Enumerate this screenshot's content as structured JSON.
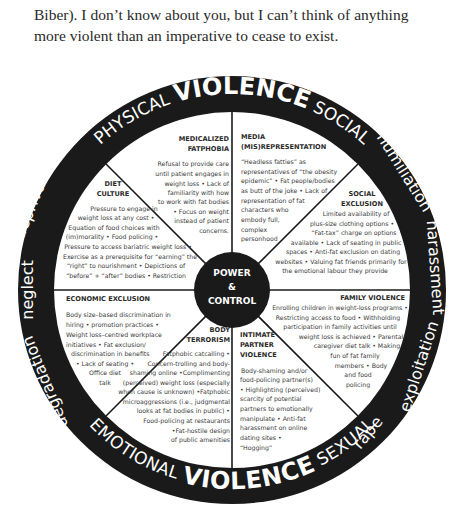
{
  "intro_text": {
    "line1": "Biber). I don’t know about you, but I can’t think of anything",
    "line2": "more violent than an imperative to cease to exist."
  },
  "wheel": {
    "center": {
      "line1": "POWER",
      "line2": "&",
      "line3": "CONTROL"
    },
    "ring_top": {
      "left": "PHYSICAL",
      "middle": "VIOLENCE",
      "right": "SOCIAL"
    },
    "ring_bottom": {
      "left": "EMOTIONAL",
      "middle": "VIOLENCE",
      "right": "SEXUAL"
    },
    "ring_left": {
      "upper": "deprivation",
      "middle": "neglect",
      "lower": "degradation"
    },
    "ring_right": {
      "upper": "humiliation",
      "middle": "harassment",
      "lower": "exploitation",
      "bottom": "rape"
    },
    "colors": {
      "ring": "#1a1a1a",
      "center": "#1a1a1a",
      "lines": "#1a1a1a",
      "fill": "#ffffff",
      "text": "#3a3a3a"
    },
    "sections": [
      {
        "id": "medicalized-fatphobia",
        "title": [
          "MEDICALIZED",
          "FATPHOBIA"
        ],
        "body": [
          "Refusal to provide care",
          "until patient engages in",
          "weight loss • Lack of",
          "familiarity  with how",
          "to work with fat bodies",
          "• Focus on weight",
          "instead of patient",
          "concerns."
        ]
      },
      {
        "id": "media-misrepresentation",
        "title": [
          "MEDIA",
          "(MIS)REPRESENTATION"
        ],
        "body": [
          "“Headless fatties” as",
          "representatives of “the obesity",
          "epidemic” • Fat people/bodies",
          "as butt of the joke • Lack of",
          "representation of fat",
          "characters who",
          "embody full,",
          "complex",
          "personhood"
        ]
      },
      {
        "id": "social-exclusion",
        "title": [
          "SOCIAL",
          "EXCLUSION"
        ],
        "body": [
          "Limited availability of",
          "plus-size clothing options •",
          "“Fat-tax” charge on options",
          "available •  Lack of seating in public",
          "spaces • Anti-fat exclusion on dating",
          "websites • Valuing fat friends primarily for",
          "the emotional labour they provide"
        ]
      },
      {
        "id": "family-violence",
        "title": [
          "FAMILY VIOLENCE"
        ],
        "body": [
          "Enrolling children in weight-loss programs •",
          "Restricting access to food •  Withholding",
          "participation in  family activities until",
          "weight loss is achieved • Parental/",
          "caregiver diet talk •  Making",
          "fun of fat family",
          "members • Body",
          "and food",
          "policing"
        ]
      },
      {
        "id": "intimate-partner-violence",
        "title": [
          "INTIMATE",
          "PARTNER",
          "VIOLENCE"
        ],
        "body": [
          "Body-shaming and/or",
          "food-policing partner(s)",
          " • Highlighting (perceived)",
          "scarcity of potential",
          "partners to emotionally",
          "manipulate • Anti-fat",
          "harassment on online",
          "dating sites •",
          "“Hogging”"
        ]
      },
      {
        "id": "body-terrorism",
        "title": [
          "BODY",
          "TERRORISM"
        ],
        "body": [
          "Fatphobic catcalling •",
          "Concern-trolling and body-",
          "shaming online •Complimenting",
          "(perceived) weight loss (especially",
          "when cause is unknown) •Fatphobic",
          "microaggressions (i.e., judgmental",
          "looks at fat bodies in public) •",
          "Food-policing at restaurants",
          "•Fat-hostile design",
          "of public amenities"
        ]
      },
      {
        "id": "economic-exclusion",
        "title": [
          "ECONOMIC EXCLUSION"
        ],
        "body": [
          "Body size–based discrimination in",
          "hiring • promotion practices •",
          "Weight loss–centred workplace",
          "initiatives • Fat exclusion/",
          "discrimination in benefits",
          "• Lack of seating •",
          "Office diet",
          "talk"
        ]
      },
      {
        "id": "diet-culture",
        "title": [
          "DIET",
          "CULTURE"
        ],
        "body": [
          "Pressure to engage in",
          "weight loss at any cost •",
          "Equation of food choices with",
          "(im)morality • Food policing •",
          "Pressure to access bariatric weight loss •",
          "Exercise as a prerequisite for “earning” the",
          "“right” to nourishment • Depictions of",
          "“before” + “after” bodies • Restriction"
        ]
      }
    ]
  }
}
